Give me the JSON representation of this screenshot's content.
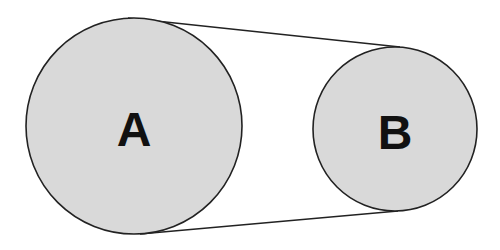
{
  "diagram": {
    "type": "belt-and-pulley",
    "colors": {
      "background": "#ffffff",
      "pulley_fill": "#d9d9d9",
      "stroke": "#222222",
      "label": "#111111"
    },
    "pulleys": [
      {
        "id": "A",
        "label": "A",
        "cx": 134,
        "cy": 126,
        "r": 108
      },
      {
        "id": "B",
        "label": "B",
        "cx": 395,
        "cy": 129,
        "r": 82
      }
    ],
    "belt": {
      "top": {
        "x1": 128,
        "y1": 18,
        "x2": 400,
        "y2": 47
      },
      "bottom": {
        "x1": 140,
        "y1": 234,
        "x2": 398,
        "y2": 211
      }
    }
  }
}
